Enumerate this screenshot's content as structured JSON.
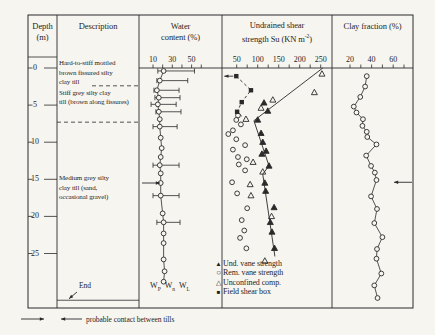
{
  "figure": {
    "header": {
      "depth_line1": "Depth",
      "depth_line2": "(m)",
      "description": "Description",
      "water_line1": "Water",
      "water_line2": "content (%)",
      "strength_line1": "Undrained shear",
      "strength_line2_pre": "strength Su (KN m",
      "strength_sup": "-2",
      "strength_line2_post": ")",
      "clay": "Clay fraction (%)"
    },
    "description_column": {
      "layers": [
        {
          "top_depth": 0,
          "lines": [
            "Hard-to-stiff mottled",
            "brown fissured silty",
            "clay till"
          ]
        },
        {
          "top_depth": 2.4,
          "lines": [
            "Stiff grey silty clay",
            "till (brown along fissures)"
          ]
        },
        {
          "top_depth": 7.3,
          "lines": [
            "Medium grey silty",
            "clay till (sand,",
            "occasional gravel)"
          ]
        }
      ],
      "end_label": "End",
      "end_depth": 31.3
    },
    "depth_axis": {
      "unit": "m",
      "ticks": [
        0,
        5,
        10,
        15,
        20,
        25
      ]
    },
    "water_legend": {
      "wp_main": "W",
      "wp_sub": "P",
      "wn_main": "W",
      "wn_sub": "n",
      "wl_main": "W",
      "wl_sub": "L"
    },
    "strength_legend": [
      {
        "marker": "filled-triangle",
        "glyph": "▲",
        "label": "Und. vane strength"
      },
      {
        "marker": "open-circle",
        "glyph": "○",
        "label": "Rem. vane strength"
      },
      {
        "marker": "open-triangle",
        "glyph": "△",
        "label": "Unconfined comp."
      },
      {
        "marker": "filled-square",
        "glyph": "■",
        "label": "Field shear box"
      }
    ],
    "footer": {
      "contact_legend": "probable contact between tills"
    },
    "colors": {
      "ink": "#2a2a2a",
      "paper": "#f7f5f0"
    }
  },
  "chart_data": [
    {
      "id": "water_content",
      "type": "scatter",
      "panel_title": "Water content (%)",
      "x_axis": {
        "ticks": [
          10,
          20,
          30,
          40,
          50,
          60
        ],
        "labeled": [
          10,
          30,
          50
        ]
      },
      "y_axis": {
        "label": "Depth (m)",
        "range": [
          0,
          32
        ]
      },
      "series": [
        {
          "name": "natural water content Wn with plastic (Wp) and liquid (WL) limits",
          "marker": "open-circle",
          "connected": true,
          "points": [
            {
              "depth": 0.4,
              "wp": 15,
              "wn": 21,
              "wl": 53
            },
            {
              "depth": 1.7,
              "wp": 14,
              "wn": 17,
              "wl": 46
            },
            {
              "depth": 3.0,
              "wp": 11,
              "wn": 14,
              "wl": 37
            },
            {
              "depth": 4.0,
              "wp": 12,
              "wn": 16,
              "wl": 38
            },
            {
              "depth": 4.9,
              "wp": 8,
              "wn": 15,
              "wl": 34
            },
            {
              "depth": 5.9,
              "wp": 13,
              "wn": 16,
              "wl": 39
            },
            {
              "depth": 6.9,
              "wp": null,
              "wn": 17,
              "wl": null
            },
            {
              "depth": 7.9,
              "wp": 10,
              "wn": 17,
              "wl": 35
            },
            {
              "depth": 9.4,
              "wp": null,
              "wn": 18,
              "wl": null
            },
            {
              "depth": 10.8,
              "wp": null,
              "wn": 19,
              "wl": null
            },
            {
              "depth": 12.0,
              "wp": null,
              "wn": 18,
              "wl": null
            },
            {
              "depth": 13.1,
              "wp": 10,
              "wn": 17,
              "wl": 37
            },
            {
              "depth": 14.2,
              "wp": null,
              "wn": 18,
              "wl": null
            },
            {
              "depth": 15.5,
              "wp": null,
              "wn": 18,
              "wl": null
            },
            {
              "depth": 17.2,
              "wp": 10,
              "wn": 18,
              "wl": 37
            },
            {
              "depth": 19.6,
              "wp": null,
              "wn": 20,
              "wl": null
            },
            {
              "depth": 20.8,
              "wp": 14,
              "wn": 21,
              "wl": 38
            },
            {
              "depth": 22.3,
              "wp": null,
              "wn": 21,
              "wl": null
            },
            {
              "depth": 23.6,
              "wp": null,
              "wn": 21,
              "wl": null
            },
            {
              "depth": 25.8,
              "wp": null,
              "wn": 21,
              "wl": null
            },
            {
              "depth": 27.4,
              "wp": null,
              "wn": 22,
              "wl": null
            },
            {
              "depth": 28.8,
              "wp": null,
              "wn": 21,
              "wl": null
            }
          ]
        }
      ],
      "annotations": [
        {
          "type": "contact-arrow",
          "depth": 15.5,
          "direction": "right"
        }
      ]
    },
    {
      "id": "undrained_shear_strength",
      "type": "scatter",
      "panel_title": "Undrained shear strength Su (KN m-2)",
      "x_axis": {
        "ticks": [
          50,
          75,
          100,
          125,
          150,
          175,
          200,
          225,
          250
        ],
        "labeled": [
          50,
          100,
          150,
          200,
          250
        ]
      },
      "y_axis": {
        "label": "Depth (m)",
        "range": [
          0,
          32
        ]
      },
      "series": [
        {
          "name": "Und. vane strength",
          "marker": "filled-triangle",
          "points": [
            [
              115,
              4.7
            ],
            [
              124,
              5.8
            ],
            [
              100,
              7.0
            ],
            [
              108,
              8.8
            ],
            [
              112,
              10.0
            ],
            [
              120,
              11.2
            ],
            [
              110,
              11.6
            ],
            [
              127,
              13.2
            ],
            [
              117,
              15.5
            ],
            [
              119,
              16.6
            ],
            [
              139,
              18.8
            ],
            [
              130,
              20.8
            ],
            [
              134,
              22.1
            ],
            [
              140,
              24.3
            ]
          ]
        },
        {
          "name": "Rem. vane strength",
          "marker": "open-circle",
          "points": [
            [
              53,
              6.4
            ],
            [
              49,
              7.0
            ],
            [
              60,
              7.6
            ],
            [
              41,
              8.4
            ],
            [
              30,
              8.9
            ],
            [
              49,
              9.6
            ],
            [
              70,
              10.4
            ],
            [
              41,
              11.0
            ],
            [
              53,
              12.0
            ],
            [
              74,
              12.3
            ],
            [
              55,
              13.0
            ],
            [
              70,
              13.8
            ],
            [
              39,
              15.4
            ],
            [
              51,
              16.9
            ],
            [
              75,
              18.9
            ],
            [
              62,
              20.5
            ],
            [
              68,
              21.9
            ],
            [
              58,
              22.9
            ],
            [
              73,
              24.3
            ]
          ]
        },
        {
          "name": "Unconfined comp.",
          "marker": "open-triangle",
          "points": [
            [
              253,
              0.8
            ],
            [
              235,
              3.3
            ],
            [
              136,
              4.3
            ],
            [
              108,
              5.4
            ],
            [
              72,
              6.9
            ],
            [
              89,
              12.7
            ],
            [
              112,
              14.0
            ],
            [
              82,
              15.7
            ],
            [
              84,
              17.2
            ],
            [
              133,
              20.0
            ],
            [
              117,
              26.0
            ]
          ]
        },
        {
          "name": "Field shear box",
          "marker": "filled-square",
          "points": [
            [
              49,
              1.1
            ],
            [
              84,
              3.0
            ],
            [
              62,
              4.6
            ],
            [
              51,
              5.9
            ]
          ]
        }
      ],
      "trend_lines": [
        {
          "name": "upper trend (unconfined)",
          "style": "solid",
          "points": [
            [
              255,
              0.0
            ],
            [
              91,
              7.1
            ]
          ]
        },
        {
          "name": "lower trend (vane)",
          "style": "solid",
          "points": [
            [
              91,
              7.1
            ],
            [
              127,
              13.2
            ],
            [
              112,
              14.3
            ],
            [
              141,
              25.4
            ]
          ]
        },
        {
          "name": "field shear box trend",
          "style": "dashed",
          "points": [
            [
              49,
              1.1
            ],
            [
              84,
              3.0
            ],
            [
              62,
              4.6
            ],
            [
              51,
              5.9
            ],
            [
              64,
              6.6
            ]
          ]
        }
      ],
      "annotations": [
        {
          "type": "offscale-arrow",
          "su": 49,
          "depth": 1.1,
          "direction": "left"
        }
      ]
    },
    {
      "id": "clay_fraction",
      "type": "line",
      "panel_title": "Clay fraction (%)",
      "x_axis": {
        "ticks": [
          20,
          30,
          40,
          50,
          60,
          70
        ],
        "labeled": [
          20,
          40,
          60
        ]
      },
      "y_axis": {
        "label": "Depth (m)",
        "range": [
          0,
          32
        ]
      },
      "series": [
        {
          "name": "clay fraction",
          "marker": "open-circle",
          "connected": true,
          "points": [
            [
              35.5,
              1.1
            ],
            [
              34,
              2.5
            ],
            [
              29.5,
              3.9
            ],
            [
              23.5,
              5.2
            ],
            [
              26,
              6.0
            ],
            [
              32,
              6.9
            ],
            [
              31.5,
              7.8
            ],
            [
              35.5,
              8.6
            ],
            [
              36,
              9.3
            ],
            [
              44.5,
              10.3
            ],
            [
              35,
              11.8
            ],
            [
              39.5,
              13.2
            ],
            [
              43,
              14.1
            ],
            [
              44.5,
              15.1
            ],
            [
              39.5,
              17.3
            ],
            [
              45,
              19.0
            ],
            [
              42.5,
              20.9
            ],
            [
              50,
              22.8
            ],
            [
              45,
              24.4
            ],
            [
              44.5,
              25.7
            ],
            [
              49,
              27.7
            ],
            [
              42.5,
              29.3
            ],
            [
              45.5,
              31.0
            ]
          ]
        }
      ],
      "annotations": [
        {
          "type": "contact-arrow",
          "depth": 15.4,
          "direction": "left"
        }
      ]
    }
  ]
}
